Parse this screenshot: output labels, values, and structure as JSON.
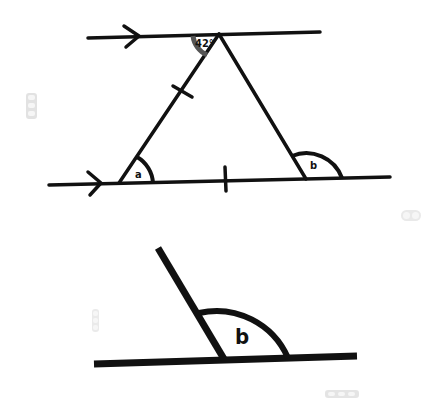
{
  "diagram": {
    "type": "geometry",
    "labels": {
      "top_angle": "42°",
      "angle_a": "a",
      "angle_b": "b",
      "angle_b_lower": "b"
    },
    "marks": {
      "parallel_arrows": 2,
      "equal_side_ticks": 2
    },
    "colors": {
      "ink": "#111111",
      "angle_42_arc": "#555555",
      "background": "#ffffff"
    }
  },
  "overlay_widgets": [
    {
      "name": "left-toolbar-top"
    },
    {
      "name": "right-zoom-control"
    },
    {
      "name": "left-toolbar-bottom"
    },
    {
      "name": "bottom-right-toolbar"
    }
  ]
}
